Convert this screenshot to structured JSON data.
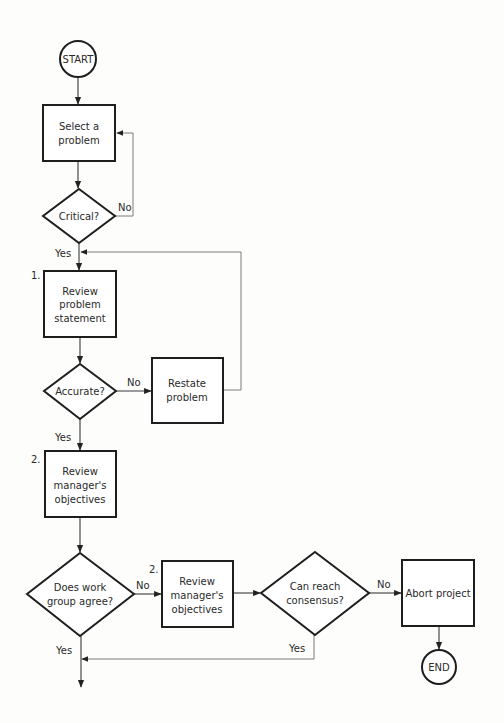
{
  "diagram": {
    "type": "flowchart",
    "nodes": {
      "start": {
        "label": "START",
        "shape": "circle"
      },
      "select": {
        "lines": [
          "Select a",
          "problem"
        ],
        "shape": "rect"
      },
      "critical": {
        "label": "Critical?",
        "shape": "diamond"
      },
      "review_statement": {
        "step": "1.",
        "lines": [
          "Review",
          "problem",
          "statement"
        ],
        "shape": "rect"
      },
      "accurate": {
        "label": "Accurate?",
        "shape": "diamond"
      },
      "restate": {
        "lines": [
          "Restate",
          "problem"
        ],
        "shape": "rect"
      },
      "review_objectives_1": {
        "step": "2.",
        "lines": [
          "Review",
          "manager's",
          "objectives"
        ],
        "shape": "rect"
      },
      "agree": {
        "lines": [
          "Does work",
          "group agree?"
        ],
        "shape": "diamond"
      },
      "review_objectives_2": {
        "step": "2.",
        "lines": [
          "Review",
          "manager's",
          "objectives"
        ],
        "shape": "rect"
      },
      "consensus": {
        "lines": [
          "Can reach",
          "consensus?"
        ],
        "shape": "diamond"
      },
      "abort": {
        "label": "Abort project",
        "shape": "rect"
      },
      "end": {
        "label": "END",
        "shape": "circle"
      }
    },
    "edge_labels": {
      "critical_no": "No",
      "critical_yes": "Yes",
      "accurate_no": "No",
      "accurate_yes": "Yes",
      "agree_no": "No",
      "agree_yes": "Yes",
      "consensus_no": "No",
      "consensus_yes": "Yes"
    },
    "edges": [
      {
        "from": "start",
        "to": "select"
      },
      {
        "from": "select",
        "to": "critical"
      },
      {
        "from": "critical",
        "to": "select",
        "label": "No"
      },
      {
        "from": "critical",
        "to": "review_statement",
        "label": "Yes"
      },
      {
        "from": "review_statement",
        "to": "accurate"
      },
      {
        "from": "accurate",
        "to": "restate",
        "label": "No"
      },
      {
        "from": "restate",
        "to": "review_statement"
      },
      {
        "from": "accurate",
        "to": "review_objectives_1",
        "label": "Yes"
      },
      {
        "from": "review_objectives_1",
        "to": "agree"
      },
      {
        "from": "agree",
        "to": "review_objectives_2",
        "label": "No"
      },
      {
        "from": "review_objectives_2",
        "to": "consensus"
      },
      {
        "from": "consensus",
        "to": "abort",
        "label": "No"
      },
      {
        "from": "abort",
        "to": "end"
      },
      {
        "from": "consensus",
        "to": "continue",
        "label": "Yes"
      },
      {
        "from": "agree",
        "to": "continue",
        "label": "Yes"
      }
    ]
  }
}
